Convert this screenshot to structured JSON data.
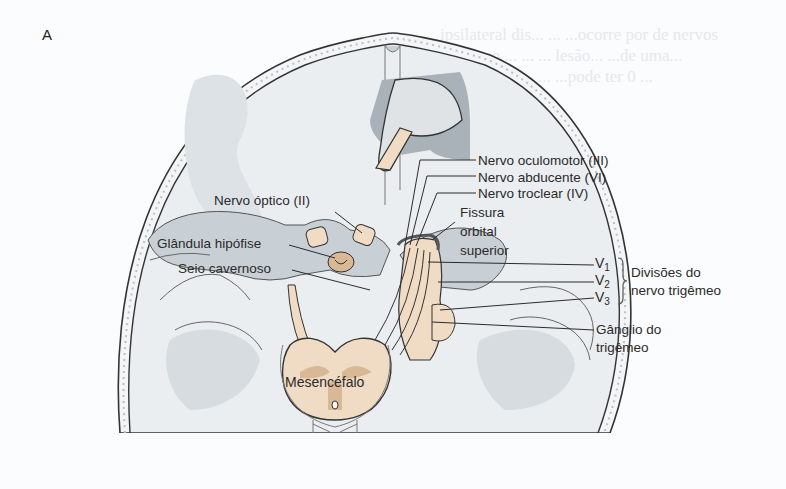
{
  "figure": {
    "panel_label": "A",
    "labels": {
      "optic_nerve": "Nervo óptico (II)",
      "pituitary": "Glândula hipófise",
      "cavernous_sinus": "Seio cavernoso",
      "oculomotor": "Nervo oculomotor (III)",
      "abducens": "Nervo abducente (VI)",
      "trochlear": "Nervo troclear (IV)",
      "fissure_line1": "Fissura",
      "fissure_line2": "orbital",
      "fissure_line3": "superior",
      "v1": "V",
      "v1_sub": "1",
      "v2": "V",
      "v2_sub": "2",
      "v3": "V",
      "v3_sub": "3",
      "divisions_line1": "Divisões do",
      "divisions_line2": "nervo trigêmeo",
      "ganglion_line1": "Gânglio do",
      "ganglion_line2": "trigêmeo",
      "midbrain": "Mesencéfalo"
    },
    "colors": {
      "skull_fill": "#eaeef1",
      "gray_region": "#c9d0d5",
      "dark_gray": "#a9b2b8",
      "nerve": "#f0dcc5",
      "midbrain_spot": "#d9b896",
      "outline": "#2b2b2b"
    }
  }
}
